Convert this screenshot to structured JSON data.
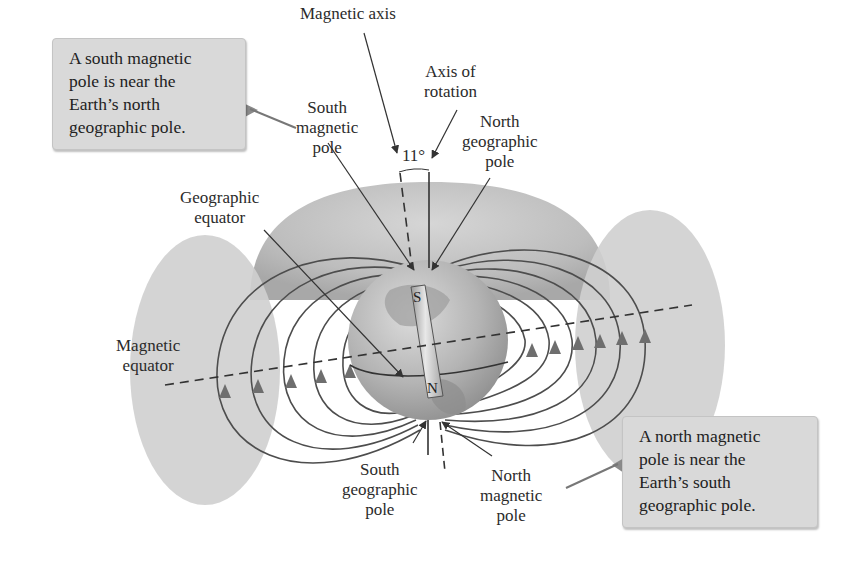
{
  "diagram": {
    "labels": {
      "magnetic_axis": "Magnetic axis",
      "axis_of_rotation": [
        "Axis of",
        "rotation"
      ],
      "south_magnetic_pole": [
        "South",
        "magnetic",
        "pole"
      ],
      "north_geographic_pole": [
        "North",
        "geographic",
        "pole"
      ],
      "angle": "11°",
      "geographic_equator": [
        "Geographic",
        "equator"
      ],
      "magnetic_equator": [
        "Magnetic",
        "equator"
      ],
      "south_geographic_pole": [
        "South",
        "geographic",
        "pole"
      ],
      "north_magnetic_pole": [
        "North",
        "magnetic",
        "pole"
      ],
      "magnet_top": "S",
      "magnet_bottom": "N"
    },
    "callouts": {
      "top_left": [
        "A south magnetic",
        "pole is near the",
        "Earth’s north",
        "geographic pole."
      ],
      "bottom_right": [
        "A north magnetic",
        "pole is near the",
        "Earth’s south",
        "geographic pole."
      ]
    },
    "colors": {
      "callout_bg": "#d9d9d9",
      "shell": "#b5b5b5",
      "field_line": "#555555",
      "arrow": "#6e6e6e",
      "globe": "#a9a9a9"
    }
  }
}
